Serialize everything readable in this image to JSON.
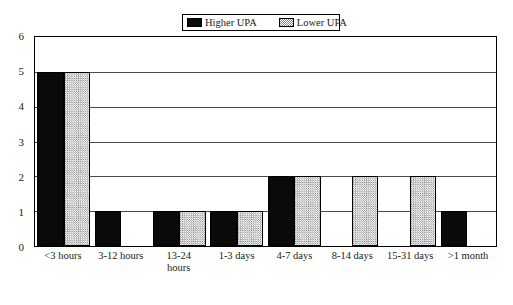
{
  "chart_data": {
    "type": "bar",
    "title": "",
    "subtitle": "",
    "xlabel": "",
    "ylabel": "",
    "ylim": [
      0,
      6
    ],
    "yticks": [
      0,
      1,
      2,
      3,
      4,
      5,
      6
    ],
    "grid": true,
    "grid_orientation": "horizontal",
    "legend_position": "top-center",
    "categories": [
      "<3 hours",
      "3-12 hours",
      "13-24\nhours",
      "1-3 days",
      "4-7 days",
      "8-14 days",
      "15-31 days",
      ">1 month"
    ],
    "series": [
      {
        "name": "Higher UPA",
        "fill": "solid-black",
        "color": "#0a0a0a",
        "values": [
          5,
          1,
          1,
          1,
          2,
          0,
          0,
          1
        ]
      },
      {
        "name": "Lower UPA",
        "fill": "stipple-gray",
        "color": "#d2d2d2",
        "values": [
          5,
          0,
          1,
          1,
          2,
          2,
          2,
          0
        ]
      }
    ]
  },
  "legend": {
    "entries": [
      {
        "label": "Higher UPA",
        "swatch": "solid-black-swatch"
      },
      {
        "label": "Lower UPA",
        "swatch": "stipple-gray-swatch"
      }
    ]
  },
  "axes": {
    "y": {
      "ticks": [
        "0",
        "1",
        "2",
        "3",
        "4",
        "5",
        "6"
      ]
    },
    "x": {
      "ticks": [
        "<3 hours",
        "3-12 hours",
        "13-24\nhours",
        "1-3 days",
        "4-7 days",
        "8-14 days",
        "15-31 days",
        ">1 month"
      ]
    }
  }
}
